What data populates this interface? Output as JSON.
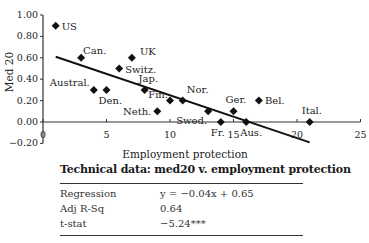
{
  "chart_data": {
    "type": "scatter",
    "title": "",
    "xlabel": "Employment protection",
    "ylabel": "Med 20",
    "xlim": [
      0,
      25
    ],
    "ylim": [
      -0.2,
      1.0
    ],
    "x_ticks": [
      "0",
      "5",
      "10",
      "15",
      "20",
      "25"
    ],
    "y_ticks": [
      "1.00",
      "0.80",
      "0.60",
      "0.40",
      "0.20",
      "0.00",
      "-0.20"
    ],
    "grid": false,
    "legend": null,
    "points": [
      {
        "label": "US",
        "x": 1,
        "y": 0.9
      },
      {
        "label": "Can.",
        "x": 3,
        "y": 0.6
      },
      {
        "label": "UK",
        "x": 7,
        "y": 0.6
      },
      {
        "label": "Switz.",
        "x": 6,
        "y": 0.5
      },
      {
        "label": "Austral.",
        "x": 4,
        "y": 0.3
      },
      {
        "label": "Den.",
        "x": 5,
        "y": 0.3
      },
      {
        "label": "Jap.",
        "x": 8,
        "y": 0.3
      },
      {
        "label": "Neth.",
        "x": 9,
        "y": 0.1
      },
      {
        "label": "Fin.",
        "x": 10,
        "y": 0.2
      },
      {
        "label": "Nor.",
        "x": 11,
        "y": 0.2
      },
      {
        "label": "Swed.",
        "x": 13,
        "y": 0.1
      },
      {
        "label": "Ger.",
        "x": 15,
        "y": 0.1
      },
      {
        "label": "Bel.",
        "x": 17,
        "y": 0.2
      },
      {
        "label": "Fr.",
        "x": 14,
        "y": 0.0
      },
      {
        "label": "Aus.",
        "x": 16,
        "y": 0.0
      },
      {
        "label": "Ital.",
        "x": 21,
        "y": 0.0
      }
    ],
    "trendline": {
      "slope": -0.04,
      "intercept": 0.65,
      "x_from": 1,
      "x_to": 21
    },
    "annotations": []
  },
  "technical": {
    "title": "Technical data:  med20 v. employment protection",
    "rows": [
      {
        "key": "Regression",
        "value": "y = −0.04x + 0.65"
      },
      {
        "key": "Adj R-Sq",
        "value": "0.64"
      },
      {
        "key": "t-stat",
        "value": "−5.24***"
      }
    ]
  }
}
